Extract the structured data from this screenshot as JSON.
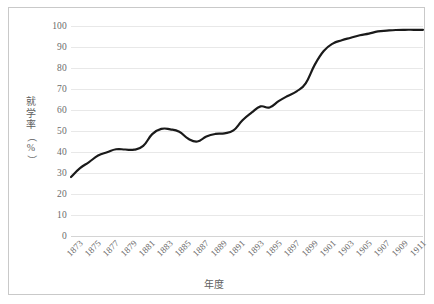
{
  "chart_data": {
    "type": "line",
    "title": "",
    "xlabel": "年度",
    "ylabel": "就学率（%）",
    "ylabel_chars": [
      "就",
      "学",
      "率",
      "（",
      "%",
      "）"
    ],
    "grid": true,
    "legend": "none",
    "xlim": [
      1873,
      1912
    ],
    "ylim": [
      0,
      100
    ],
    "y_ticks": [
      0,
      10,
      20,
      30,
      40,
      50,
      60,
      70,
      80,
      90,
      100
    ],
    "x_tick_labels": [
      "1873",
      "1875",
      "1877",
      "1879",
      "1881",
      "1883",
      "1885",
      "1887",
      "1889",
      "1891",
      "1893",
      "1895",
      "1897",
      "1899",
      "1901",
      "1903",
      "1905",
      "1907",
      "1909",
      "1911"
    ],
    "series": [
      {
        "name": "就学率",
        "color": "#1a1a1a",
        "x": [
          1873,
          1874,
          1875,
          1876,
          1877,
          1878,
          1879,
          1880,
          1881,
          1882,
          1883,
          1884,
          1885,
          1886,
          1887,
          1888,
          1889,
          1890,
          1891,
          1892,
          1893,
          1894,
          1895,
          1896,
          1897,
          1898,
          1899,
          1900,
          1901,
          1902,
          1903,
          1904,
          1905,
          1906,
          1907,
          1908,
          1909,
          1910,
          1911,
          1912
        ],
        "values": [
          28.1,
          32.3,
          35.2,
          38.3,
          39.9,
          41.3,
          41.2,
          41.1,
          42.9,
          48.5,
          51.0,
          50.8,
          49.6,
          46.3,
          45.0,
          47.4,
          48.6,
          48.9,
          50.3,
          55.1,
          58.7,
          61.7,
          61.2,
          64.2,
          66.7,
          68.9,
          72.7,
          81.5,
          88.1,
          91.6,
          93.2,
          94.4,
          95.6,
          96.4,
          97.4,
          97.8,
          98.1,
          98.2,
          98.2,
          98.2
        ],
        "line_width": 2.2
      }
    ]
  }
}
